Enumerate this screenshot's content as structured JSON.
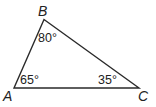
{
  "diagram": {
    "type": "triangle",
    "stroke_color": "#2a2a2a",
    "vertices": [
      {
        "name": "A",
        "x": 14,
        "y": 88,
        "angle": "65°"
      },
      {
        "name": "B",
        "x": 44,
        "y": 19.5,
        "angle": "80°"
      },
      {
        "name": "C",
        "x": 139,
        "y": 88,
        "angle": "35°"
      }
    ],
    "labels": {
      "A": "A",
      "B": "B",
      "C": "C"
    },
    "angles": {
      "A": "65°",
      "B": "80°",
      "C": "35°"
    }
  }
}
